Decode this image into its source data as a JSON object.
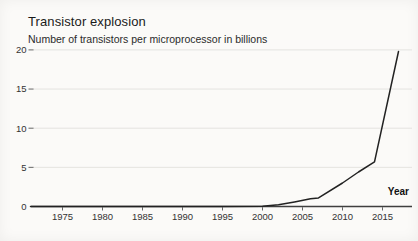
{
  "chart_data": {
    "type": "line",
    "title": "Transistor explosion",
    "subtitle": "Number of transistors per microprocessor in billions",
    "xlabel": "Year",
    "ylabel": "",
    "xlim": [
      1971,
      2018.7
    ],
    "ylim": [
      0,
      20
    ],
    "x_ticks": [
      "1975",
      "1980",
      "1985",
      "1990",
      "1995",
      "2000",
      "2005",
      "2010",
      "2015"
    ],
    "y_ticks": [
      "0",
      "5",
      "10",
      "15",
      "20"
    ],
    "grid": "horizontal-only",
    "legend": "none",
    "colors": {
      "line": "#222222",
      "grid": "#e4e3e0",
      "axis": "#3f3f3f",
      "tick": "#666666",
      "tick_label": "#333333",
      "title": "#1a1a1a",
      "background": "#fbfaf8"
    },
    "series": [
      {
        "name": "Transistors per microprocessor (billions)",
        "points": [
          [
            1971,
            2e-06
          ],
          [
            1975,
            1e-05
          ],
          [
            1980,
            3e-05
          ],
          [
            1985,
            0.0003
          ],
          [
            1990,
            0.001
          ],
          [
            1995,
            0.006
          ],
          [
            2000,
            0.04
          ],
          [
            2002,
            0.22
          ],
          [
            2004,
            0.59
          ],
          [
            2006,
            1.0
          ],
          [
            2007,
            1.1
          ],
          [
            2010,
            3.0
          ],
          [
            2012,
            4.4
          ],
          [
            2014,
            5.7
          ],
          [
            2017,
            19.8
          ]
        ]
      }
    ]
  }
}
